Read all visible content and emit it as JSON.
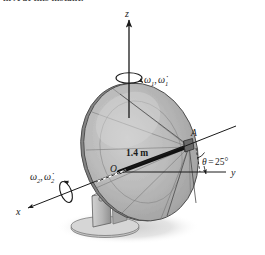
{
  "figure": {
    "caption_fragment": "in A at this instant.",
    "type": "mechanics-free-body-diagram",
    "background_color": "#ffffff",
    "axes": {
      "z": {
        "label": "z",
        "direction": "vertical-up",
        "color": "#1a1a1a"
      },
      "y": {
        "label": "y",
        "direction": "horizontal-right",
        "color": "#1a1a1a"
      },
      "x": {
        "label": "x",
        "direction": "lower-left-oblique",
        "color": "#1a1a1a"
      }
    },
    "angular_velocities": [
      {
        "label": "ω",
        "sub": "1",
        "dot_label": "ω̇",
        "dot_sub": "1",
        "text": "ω₁, ω̇1",
        "about_axis": "z"
      },
      {
        "label": "ω",
        "sub": "2",
        "dot_label": "ω̇",
        "dot_sub": "2",
        "text": "ω₂, ω̇2",
        "about_axis": "x"
      }
    ],
    "points": [
      {
        "name": "O",
        "label": "O",
        "role": "dish-center-origin"
      },
      {
        "name": "A",
        "label": "A",
        "role": "feed-horn-tip"
      }
    ],
    "dimensions": [
      {
        "name": "dish-axis-length",
        "label": "1.4 m",
        "from": "O",
        "to": "A"
      }
    ],
    "angle": {
      "name": "tilt-angle",
      "symbol": "θ",
      "equals": "=",
      "value": "25°",
      "text": "θ = 25°",
      "between": "y-axis and dish axis OA"
    },
    "colors": {
      "dish_front_light": "#c2c2c2",
      "dish_front_mid": "#aeaeae",
      "dish_front_dark": "#9a9a9a",
      "dish_rim": "#8c8c8c",
      "dish_back": "#7e7e7e",
      "pedestal": "#bdbdbd",
      "pedestal_shade": "#9a9a9a",
      "base_plate": "#c8c8c8",
      "shadow": "#d8d8d8",
      "line": "#1a1a1a",
      "thin_line": "#555555"
    }
  }
}
